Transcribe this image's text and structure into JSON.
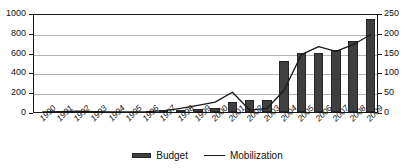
{
  "chart_data": {
    "type": "bar",
    "title": "",
    "xlabel": "",
    "ylabel": "",
    "grid": true,
    "legend_position": "bottom-center",
    "categories": [
      "1990",
      "1991",
      "1992",
      "1993",
      "1994",
      "1995",
      "1996",
      "1997",
      "1998",
      "1999",
      "2000",
      "2001",
      "2002",
      "2003",
      "2004",
      "2005",
      "2006",
      "2007",
      "2008",
      "2009"
    ],
    "axes": {
      "left": {
        "label": "",
        "ylim": [
          0,
          1000
        ],
        "ticks": [
          0,
          200,
          400,
          600,
          800,
          1000
        ],
        "tick_labels": [
          "0",
          "200",
          "400",
          "600",
          "800",
          "1000"
        ]
      },
      "right": {
        "label": "",
        "ylim": [
          0,
          250
        ],
        "ticks": [
          0,
          50,
          100,
          150,
          200,
          250
        ],
        "tick_labels": [
          "0",
          "50",
          "100",
          "150",
          "200",
          "250"
        ]
      }
    },
    "series": [
      {
        "name": "Budget",
        "type": "bar",
        "axis": "left",
        "color": "#3f3f3f",
        "values": [
          2,
          2,
          2,
          2,
          2,
          2,
          3,
          10,
          15,
          30,
          40,
          100,
          125,
          125,
          520,
          595,
          595,
          630,
          720,
          940
        ]
      },
      {
        "name": "Mobilization",
        "type": "line",
        "axis": "right",
        "color": "#1a1a1a",
        "values": [
          5,
          6,
          7,
          6,
          5,
          5,
          6,
          8,
          14,
          22,
          30,
          55,
          10,
          14,
          60,
          150,
          170,
          158,
          175,
          200
        ]
      }
    ]
  },
  "legend": {
    "items": [
      {
        "label": "Budget",
        "marker": "bar-swatch"
      },
      {
        "label": "Mobilization",
        "marker": "line-swatch"
      }
    ]
  }
}
